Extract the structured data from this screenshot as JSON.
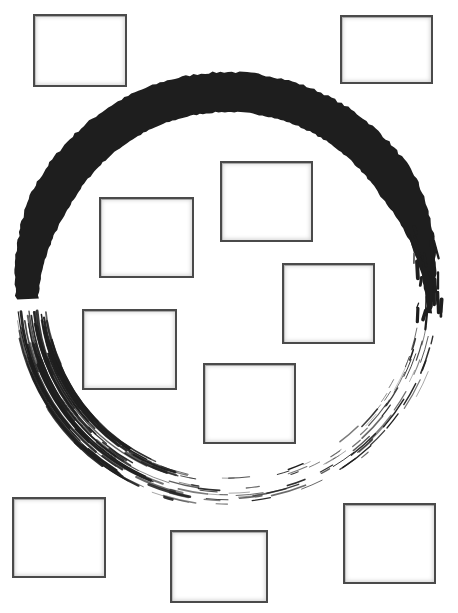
{
  "canvas": {
    "width": 458,
    "height": 613,
    "background": "#ffffff"
  },
  "enso": {
    "name": "enso-brush-circle",
    "cx": 228,
    "cy": 292,
    "r": 202,
    "ink_color": "#1e1e1e",
    "solid_stroke": {
      "from_deg": 182,
      "to_deg": 358,
      "max_width": 40
    }
  },
  "frames": [
    {
      "id": "frame-1",
      "x": 33,
      "y": 14,
      "w": 94,
      "h": 73
    },
    {
      "id": "frame-2",
      "x": 340,
      "y": 15,
      "w": 93,
      "h": 69
    },
    {
      "id": "frame-3",
      "x": 220,
      "y": 161,
      "w": 93,
      "h": 81
    },
    {
      "id": "frame-4",
      "x": 99,
      "y": 197,
      "w": 95,
      "h": 81
    },
    {
      "id": "frame-5",
      "x": 282,
      "y": 263,
      "w": 93,
      "h": 81
    },
    {
      "id": "frame-6",
      "x": 82,
      "y": 309,
      "w": 95,
      "h": 81
    },
    {
      "id": "frame-7",
      "x": 203,
      "y": 363,
      "w": 93,
      "h": 81
    },
    {
      "id": "frame-8",
      "x": 12,
      "y": 497,
      "w": 94,
      "h": 81
    },
    {
      "id": "frame-9",
      "x": 170,
      "y": 530,
      "w": 98,
      "h": 73
    },
    {
      "id": "frame-10",
      "x": 343,
      "y": 503,
      "w": 93,
      "h": 81
    }
  ]
}
